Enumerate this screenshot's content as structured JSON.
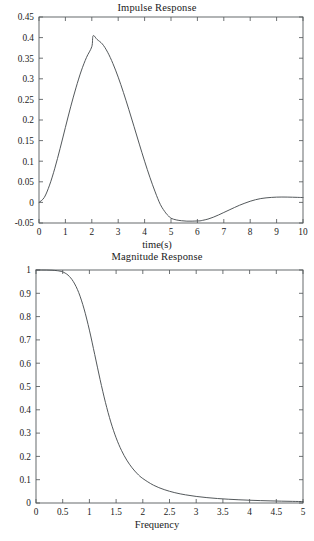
{
  "page": {
    "background_color": "#ffffff",
    "foreground_color": "#1a1a1a",
    "axis_color": "#555a5c",
    "curve_color": "#4a4f52"
  },
  "figures": [
    {
      "id": "impulse",
      "title": "Impulse Response",
      "xlabel": "time(s)",
      "ylabel": ""
    },
    {
      "id": "magnitude",
      "title": "Magnitude Response",
      "xlabel": "Frequency",
      "ylabel": ""
    }
  ],
  "chart_data": [
    {
      "type": "line",
      "title": "Impulse Response",
      "xlabel": "time(s)",
      "ylabel": "",
      "xlim": [
        0,
        10
      ],
      "ylim": [
        -0.05,
        0.45
      ],
      "xticks": [
        0,
        1,
        2,
        3,
        4,
        5,
        6,
        7,
        8,
        9,
        10
      ],
      "xticklabels": [
        "0",
        "1",
        "2",
        "3",
        "4",
        "5",
        "6",
        "7",
        "8",
        "9",
        "10"
      ],
      "yticks": [
        -0.05,
        0,
        0.05,
        0.1,
        0.15,
        0.2,
        0.25,
        0.3,
        0.35,
        0.4,
        0.45
      ],
      "yticklabels": [
        "-0.05",
        "0",
        "0.05",
        "0.1",
        "0.15",
        "0.2",
        "0.25",
        "0.3",
        "0.35",
        "0.4",
        "0.45"
      ],
      "grid": false,
      "legend": null,
      "series": [
        {
          "name": "impulse response",
          "x": [
            0,
            0.2,
            0.4,
            0.6,
            0.8,
            1.0,
            1.2,
            1.4,
            1.6,
            1.8,
            2.0,
            2.05,
            2.2,
            2.4,
            2.6,
            2.8,
            3.0,
            3.2,
            3.4,
            3.6,
            3.8,
            4.0,
            4.2,
            4.4,
            4.6,
            4.8,
            4.9,
            5.0,
            5.2,
            5.4,
            5.6,
            5.8,
            6.0,
            6.1,
            6.2,
            6.4,
            6.6,
            6.8,
            7.0,
            7.2,
            7.4,
            7.6,
            7.8,
            8.0,
            8.2,
            8.4,
            8.6,
            8.8,
            9.0,
            9.2,
            9.4,
            9.6,
            9.8,
            10.0
          ],
          "y": [
            0,
            0.012,
            0.042,
            0.083,
            0.131,
            0.182,
            0.232,
            0.278,
            0.319,
            0.352,
            0.378,
            0.4045,
            0.3955,
            0.3845,
            0.3645,
            0.337,
            0.304,
            0.2665,
            0.226,
            0.184,
            0.1415,
            0.1,
            0.061,
            0.0255,
            -0.0055,
            -0.0255,
            -0.0325,
            -0.0385,
            -0.0425,
            -0.0445,
            -0.0455,
            -0.0455,
            -0.045,
            -0.0448,
            -0.0435,
            -0.0405,
            -0.036,
            -0.0305,
            -0.0245,
            -0.0185,
            -0.0125,
            -0.0068,
            -0.0018,
            0.0028,
            0.0065,
            0.0093,
            0.011,
            0.0121,
            0.0128,
            0.013,
            0.0129,
            0.0126,
            0.0122,
            0.0118
          ]
        }
      ],
      "annotations": {
        "peak_value": 0.405,
        "peak_time": 2.05,
        "zero_crossing_time": 4.85,
        "trough_value": -0.0455,
        "trough_time": 5.9
      }
    },
    {
      "type": "line",
      "title": "Magnitude Response",
      "xlabel": "Frequency",
      "ylabel": "",
      "xlim": [
        0,
        5
      ],
      "ylim": [
        0,
        1
      ],
      "xticks": [
        0,
        0.5,
        1,
        1.5,
        2,
        2.5,
        3,
        3.5,
        4,
        4.5,
        5
      ],
      "xticklabels": [
        "0",
        "0.5",
        "1",
        "1.5",
        "2",
        "2.5",
        "3",
        "3.5",
        "4",
        "4.5",
        "5"
      ],
      "yticks": [
        0,
        0.1,
        0.2,
        0.3,
        0.4,
        0.5,
        0.6,
        0.7,
        0.8,
        0.9,
        1
      ],
      "yticklabels": [
        "0",
        "0.1",
        "0.2",
        "0.3",
        "0.4",
        "0.5",
        "0.6",
        "0.7",
        "0.8",
        "0.9",
        "1"
      ],
      "grid": false,
      "legend": null,
      "series": [
        {
          "name": "magnitude response",
          "x": [
            0,
            0.1,
            0.2,
            0.3,
            0.4,
            0.45,
            0.5,
            0.6,
            0.7,
            0.8,
            0.9,
            1.0,
            1.1,
            1.2,
            1.3,
            1.4,
            1.5,
            1.6,
            1.7,
            1.8,
            1.9,
            2.0,
            2.2,
            2.4,
            2.6,
            2.8,
            3.0,
            3.2,
            3.4,
            3.6,
            3.8,
            4.0,
            4.2,
            4.4,
            4.6,
            4.8,
            5.0
          ],
          "y": [
            1.0,
            1.0,
            0.9998,
            0.999,
            0.997,
            0.995,
            0.992,
            0.978,
            0.95,
            0.903,
            0.833,
            0.742,
            0.637,
            0.53,
            0.432,
            0.348,
            0.28,
            0.226,
            0.184,
            0.151,
            0.125,
            0.105,
            0.0765,
            0.0575,
            0.0443,
            0.035,
            0.0282,
            0.0231,
            0.0192,
            0.0162,
            0.0138,
            0.0119,
            0.0103,
            0.009,
            0.0079,
            0.007,
            0.0062
          ]
        }
      ],
      "annotations": {
        "passband_value": 1.0,
        "cutoff_frequency": 1.0,
        "cutoff_value": 0.742
      }
    }
  ]
}
